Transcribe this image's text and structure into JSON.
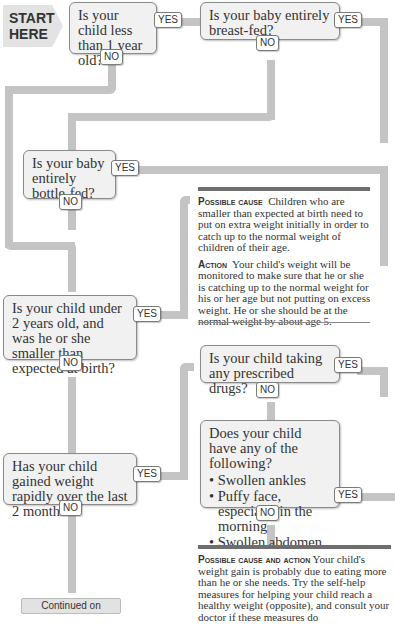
{
  "start_label": "START HERE",
  "start_line1": "START",
  "start_line2": "HERE",
  "yes_label": "YES",
  "no_label": "NO",
  "q1": "Is your child less than 1 year old?",
  "q2": "Is your baby entirely breast-fed?",
  "q3": "Is your baby entirely bottle-fed?",
  "q4": "Is your child under 2 years old, and was he or she smaller than expected at birth?",
  "q5": "Has your child gained weight rapidly over the last 2 months?",
  "q6": "Is your child taking any prescribed drugs?",
  "q7": {
    "question": "Does your child have any of the following?",
    "items": [
      "Swollen ankles",
      "Puffy face, especially in the morning",
      "Swollen abdomen"
    ]
  },
  "note1": {
    "cause_lead": "Possible cause",
    "cause_text": "Children who are smaller than expected at birth need to put on extra weight initially in order to catch up to the normal weight of children of their age.",
    "action_lead": "Action",
    "action_text": "Your child's weight will be monitored to make sure that he or she is catching up to the normal weight for his or her age but not putting on excess weight. He or she should be at the normal weight by about age 5."
  },
  "note2": {
    "lead": "Possible cause and action",
    "text": "Your child's weight gain is probably due to eating more than he or she needs. Try the self-help measures for helping your child reach a healthy weight (opposite), and consult your doctor if these measures do"
  },
  "continued_label": "Continued on",
  "colors": {
    "path": "#c4c4c4",
    "box_bg": "#f1f1f1",
    "box_border": "#8a8a8a",
    "rule": "#6e6e6e"
  }
}
